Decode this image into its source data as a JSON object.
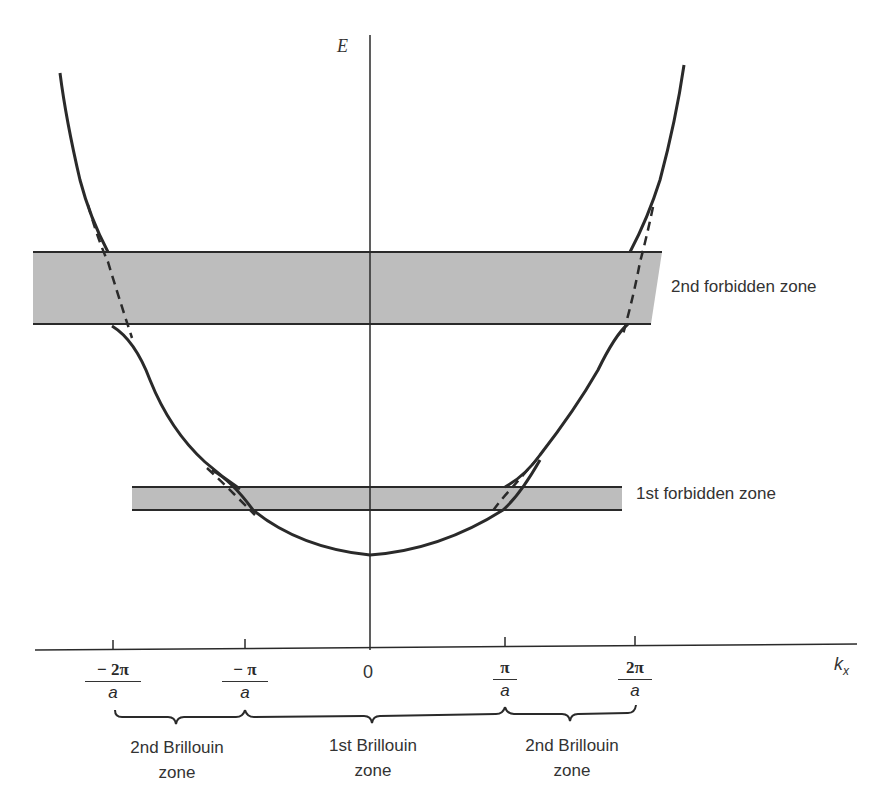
{
  "diagram": {
    "title": "",
    "axes": {
      "y_label": "E",
      "x_label_main": "k",
      "x_label_sub": "x"
    },
    "ticks": [
      {
        "id": "neg2pi",
        "numerator": "− 2π",
        "denominator": "a",
        "value_pi_over_a": -2
      },
      {
        "id": "negpi",
        "numerator": "− π",
        "denominator": "a",
        "value_pi_over_a": -1
      },
      {
        "id": "zero",
        "label": "0",
        "value_pi_over_a": 0
      },
      {
        "id": "pi",
        "numerator": "π",
        "denominator": "a",
        "value_pi_over_a": 1
      },
      {
        "id": "twopi",
        "numerator": "2π",
        "denominator": "a",
        "value_pi_over_a": 2
      }
    ],
    "bands": [
      {
        "id": "first",
        "label": "1st forbidden zone"
      },
      {
        "id": "second",
        "label": "2nd forbidden zone"
      }
    ],
    "brillouin_zones": [
      {
        "id": "second-left",
        "line1": "2nd Brillouin",
        "line2": "zone",
        "range": "-2π/a to -π/a"
      },
      {
        "id": "first",
        "line1": "1st Brillouin",
        "line2": "zone",
        "range": "-π/a to π/a"
      },
      {
        "id": "second-right",
        "line1": "2nd Brillouin",
        "line2": "zone",
        "range": "π/a to 2π/a"
      }
    ],
    "legend_notes": {
      "solid_curve": "actual E(k) with band gaps",
      "dashed_curve": "free-electron parabola"
    },
    "colors": {
      "ink": "#2a2a2a",
      "band_fill": "#bdbdbd",
      "background": "#ffffff"
    }
  }
}
